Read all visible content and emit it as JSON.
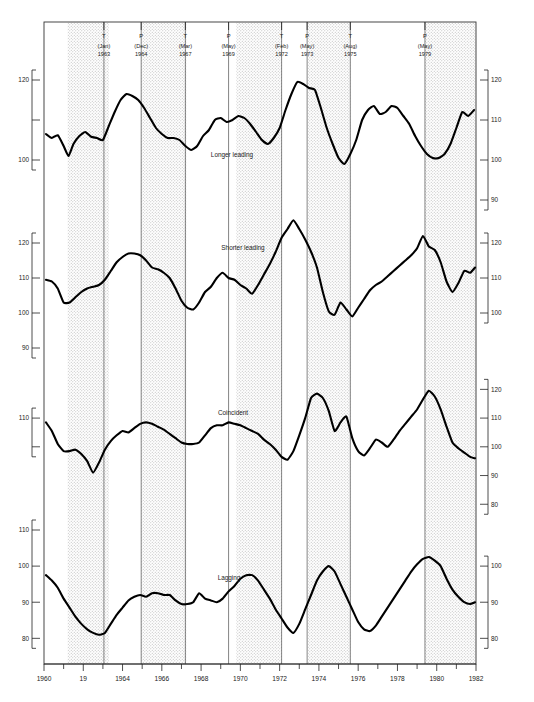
{
  "meta": {
    "kind": "composite-index-business-cycle-chart",
    "panel_count": 4
  },
  "chart_data": {
    "type": "line",
    "title": "",
    "xlabel": "",
    "ylabel": "",
    "grid": false,
    "legend_position": "inline-panel-label",
    "xlim": [
      1960,
      1982
    ],
    "x_ticks_labeled": [
      "1960",
      "19",
      "1964",
      "1966",
      "1968",
      "1970",
      "1972",
      "1974",
      "1976",
      "1978",
      "1980",
      "1982"
    ],
    "x_ticks_values": [
      1960,
      1962,
      1964,
      1966,
      1968,
      1970,
      1972,
      1974,
      1976,
      1978,
      1980,
      1982
    ],
    "x_minor_ticks": [
      1961,
      1963,
      1965,
      1967,
      1969,
      1971,
      1973,
      1975,
      1977,
      1979,
      1981
    ],
    "recession_bands": [
      {
        "start": 1961.2,
        "end": 1963.3
      },
      {
        "start": 1964.95,
        "end": 1967.25
      },
      {
        "start": 1969.8,
        "end": 1972.1
      },
      {
        "start": 1973.45,
        "end": 1975.6
      },
      {
        "start": 1979.4,
        "end": 1982.0
      }
    ],
    "turning_points": [
      {
        "type": "T",
        "month": "Jan",
        "year": "1963",
        "x": 1963.05
      },
      {
        "type": "P",
        "month": "Dec",
        "year": "1964",
        "x": 1964.95
      },
      {
        "type": "T",
        "month": "Mar",
        "year": "1967",
        "x": 1967.2
      },
      {
        "type": "P",
        "month": "May",
        "year": "1969",
        "x": 1969.4
      },
      {
        "type": "T",
        "month": "Feb",
        "year": "1972",
        "x": 1972.1
      },
      {
        "type": "P",
        "month": "May",
        "year": "1973",
        "x": 1973.4
      },
      {
        "type": "T",
        "month": "Aug",
        "year": "1975",
        "x": 1975.6
      },
      {
        "type": "P",
        "month": "May",
        "year": "1979",
        "x": 1979.4
      }
    ],
    "panels": [
      {
        "name": "Longer leading",
        "label": "Longer leading",
        "ylim": [
          90,
          125
        ],
        "left_ticks": [
          {
            "value": 120,
            "label": "120"
          },
          {
            "value": 110,
            "label": ""
          },
          {
            "value": 100,
            "label": "100"
          }
        ],
        "right_ticks": [
          {
            "value": 120,
            "label": "120"
          },
          {
            "value": 110,
            "label": "110"
          },
          {
            "value": 100,
            "label": "100"
          },
          {
            "value": 90,
            "label": "90"
          }
        ],
        "x": [
          1960.1,
          1960.4,
          1960.7,
          1961.0,
          1961.25,
          1961.5,
          1961.8,
          1962.1,
          1962.4,
          1962.7,
          1963.0,
          1963.3,
          1963.6,
          1963.9,
          1964.2,
          1964.5,
          1964.8,
          1965.1,
          1965.4,
          1965.7,
          1966.0,
          1966.3,
          1966.6,
          1966.9,
          1967.2,
          1967.5,
          1967.8,
          1968.1,
          1968.4,
          1968.7,
          1969.0,
          1969.3,
          1969.6,
          1969.9,
          1970.2,
          1970.5,
          1970.8,
          1971.1,
          1971.4,
          1971.7,
          1972.0,
          1972.3,
          1972.6,
          1972.9,
          1973.2,
          1973.5,
          1973.8,
          1974.1,
          1974.4,
          1974.7,
          1975.0,
          1975.3,
          1975.6,
          1975.9,
          1976.2,
          1976.5,
          1976.8,
          1977.1,
          1977.4,
          1977.7,
          1978.0,
          1978.3,
          1978.6,
          1978.9,
          1979.2,
          1979.5,
          1979.8,
          1980.1,
          1980.4,
          1980.7,
          1981.0,
          1981.3,
          1981.6,
          1981.9
        ],
        "y": [
          106.5,
          105.5,
          106.2,
          103.5,
          101.0,
          104.0,
          106.0,
          107.0,
          105.8,
          105.5,
          105.0,
          108.5,
          112.0,
          115.0,
          116.5,
          116.0,
          115.0,
          113.0,
          110.5,
          108.0,
          106.5,
          105.5,
          105.5,
          105.0,
          103.5,
          102.5,
          103.5,
          106.0,
          107.5,
          110.0,
          110.5,
          109.5,
          110.0,
          111.0,
          110.5,
          109.0,
          107.0,
          105.0,
          104.0,
          105.5,
          108.0,
          112.5,
          116.5,
          119.5,
          119.0,
          118.0,
          117.5,
          113.0,
          108.0,
          104.0,
          100.5,
          99.0,
          101.5,
          105.0,
          110.0,
          112.5,
          113.5,
          111.5,
          112.0,
          113.5,
          113.0,
          111.0,
          109.0,
          106.0,
          103.5,
          101.5,
          100.5,
          100.5,
          101.5,
          104.0,
          108.0,
          112.0,
          111.0,
          112.5
        ]
      },
      {
        "name": "Shorter leading",
        "label": "Shorter leading",
        "ylim": [
          88,
          128
        ],
        "left_ticks": [
          {
            "value": 120,
            "label": "120"
          },
          {
            "value": 110,
            "label": "110"
          },
          {
            "value": 100,
            "label": "100"
          },
          {
            "value": 90,
            "label": "90"
          }
        ],
        "right_ticks": [
          {
            "value": 120,
            "label": "120"
          },
          {
            "value": 110,
            "label": "110"
          },
          {
            "value": 100,
            "label": "100"
          }
        ],
        "x": [
          1960.1,
          1960.4,
          1960.7,
          1961.0,
          1961.3,
          1961.6,
          1961.9,
          1962.2,
          1962.5,
          1962.8,
          1963.1,
          1963.4,
          1963.7,
          1964.0,
          1964.3,
          1964.6,
          1964.9,
          1965.2,
          1965.5,
          1965.8,
          1966.1,
          1966.4,
          1966.7,
          1967.0,
          1967.3,
          1967.6,
          1967.9,
          1968.2,
          1968.5,
          1968.8,
          1969.1,
          1969.4,
          1969.7,
          1970.0,
          1970.3,
          1970.6,
          1970.9,
          1971.2,
          1971.5,
          1971.8,
          1972.1,
          1972.4,
          1972.7,
          1973.0,
          1973.3,
          1973.6,
          1973.9,
          1974.2,
          1974.5,
          1974.8,
          1975.1,
          1975.4,
          1975.7,
          1976.0,
          1976.3,
          1976.6,
          1976.9,
          1977.2,
          1977.5,
          1977.8,
          1978.1,
          1978.4,
          1978.7,
          1979.0,
          1979.3,
          1979.6,
          1979.9,
          1980.2,
          1980.5,
          1980.8,
          1981.1,
          1981.4,
          1981.7,
          1981.95
        ],
        "y": [
          109.5,
          109.0,
          107.0,
          103.0,
          103.0,
          104.5,
          106.0,
          107.0,
          107.5,
          108.0,
          109.5,
          112.0,
          114.5,
          116.0,
          117.0,
          117.0,
          116.5,
          115.0,
          113.0,
          112.5,
          111.5,
          110.0,
          107.0,
          103.5,
          101.5,
          101.0,
          103.0,
          106.0,
          107.5,
          110.0,
          111.5,
          110.0,
          109.5,
          108.0,
          107.0,
          105.5,
          108.0,
          111.0,
          114.0,
          117.5,
          121.5,
          124.0,
          126.5,
          124.0,
          121.0,
          117.5,
          113.0,
          106.0,
          100.5,
          99.5,
          103.0,
          101.0,
          99.0,
          101.5,
          104.0,
          106.5,
          108.0,
          109.0,
          110.5,
          112.0,
          113.5,
          115.0,
          116.5,
          118.5,
          122.0,
          119.0,
          118.0,
          114.5,
          109.0,
          106.0,
          108.5,
          112.0,
          111.5,
          113.0
        ]
      },
      {
        "name": "Coincident",
        "label": "Coincident",
        "ylim": [
          78,
          125
        ],
        "left_ticks": [
          {
            "value": 110,
            "label": "110"
          },
          {
            "value": 100,
            "label": ""
          }
        ],
        "right_ticks": [
          {
            "value": 120,
            "label": "120"
          },
          {
            "value": 110,
            "label": "110"
          },
          {
            "value": 100,
            "label": "100"
          },
          {
            "value": 90,
            "label": "90"
          },
          {
            "value": 80,
            "label": "80"
          }
        ],
        "x": [
          1960.1,
          1960.4,
          1960.7,
          1961.0,
          1961.3,
          1961.6,
          1961.9,
          1962.2,
          1962.5,
          1962.8,
          1963.1,
          1963.4,
          1963.7,
          1964.0,
          1964.3,
          1964.6,
          1964.9,
          1965.2,
          1965.5,
          1965.8,
          1966.1,
          1966.4,
          1966.7,
          1967.0,
          1967.3,
          1967.6,
          1967.9,
          1968.2,
          1968.5,
          1968.8,
          1969.1,
          1969.4,
          1969.7,
          1970.0,
          1970.3,
          1970.6,
          1970.9,
          1971.2,
          1971.5,
          1971.8,
          1972.1,
          1972.4,
          1972.7,
          1973.0,
          1973.3,
          1973.6,
          1973.9,
          1974.2,
          1974.5,
          1974.8,
          1975.1,
          1975.4,
          1975.7,
          1976.0,
          1976.3,
          1976.6,
          1976.9,
          1977.2,
          1977.5,
          1977.8,
          1978.1,
          1978.4,
          1978.7,
          1979.0,
          1979.3,
          1979.6,
          1979.9,
          1980.2,
          1980.5,
          1980.8,
          1981.1,
          1981.4,
          1981.7,
          1981.95
        ],
        "y": [
          108.5,
          105.5,
          101.0,
          98.5,
          98.5,
          99.0,
          97.5,
          95.0,
          91.0,
          94.5,
          99.0,
          102.0,
          104.0,
          105.5,
          105.0,
          106.5,
          108.0,
          108.5,
          108.0,
          107.0,
          106.0,
          104.5,
          103.0,
          101.5,
          101.0,
          101.0,
          101.5,
          104.0,
          106.5,
          107.5,
          107.5,
          108.5,
          108.0,
          107.5,
          106.5,
          105.5,
          104.5,
          102.5,
          101.0,
          99.0,
          96.5,
          95.5,
          98.5,
          104.0,
          110.0,
          117.0,
          118.5,
          117.0,
          112.5,
          105.5,
          108.5,
          110.5,
          103.0,
          98.5,
          97.0,
          99.5,
          102.5,
          101.5,
          100.0,
          102.5,
          105.5,
          108.0,
          110.5,
          113.0,
          116.5,
          119.5,
          117.5,
          113.0,
          107.0,
          101.5,
          99.5,
          98.0,
          96.5,
          96.0
        ]
      },
      {
        "name": "Lagging",
        "label": "Lagging",
        "ylim": [
          74,
          110
        ],
        "left_ticks": [
          {
            "value": 110,
            "label": "110"
          },
          {
            "value": 100,
            "label": "100"
          },
          {
            "value": 90,
            "label": "90"
          },
          {
            "value": 80,
            "label": "80"
          }
        ],
        "right_ticks": [
          {
            "value": 100,
            "label": "100"
          },
          {
            "value": 90,
            "label": "90"
          },
          {
            "value": 80,
            "label": "80"
          }
        ],
        "x": [
          1960.1,
          1960.4,
          1960.7,
          1961.0,
          1961.3,
          1961.6,
          1961.9,
          1962.2,
          1962.5,
          1962.8,
          1963.1,
          1963.4,
          1963.7,
          1964.0,
          1964.3,
          1964.6,
          1964.9,
          1965.2,
          1965.5,
          1965.8,
          1966.1,
          1966.4,
          1966.7,
          1967.0,
          1967.3,
          1967.6,
          1967.9,
          1968.2,
          1968.5,
          1968.8,
          1969.1,
          1969.4,
          1969.7,
          1970.0,
          1970.3,
          1970.6,
          1970.9,
          1971.2,
          1971.5,
          1971.8,
          1972.1,
          1972.4,
          1972.7,
          1973.0,
          1973.3,
          1973.6,
          1973.9,
          1974.2,
          1974.5,
          1974.8,
          1975.1,
          1975.4,
          1975.7,
          1976.0,
          1976.3,
          1976.6,
          1976.9,
          1977.2,
          1977.5,
          1977.8,
          1978.1,
          1978.4,
          1978.7,
          1979.0,
          1979.3,
          1979.6,
          1979.9,
          1980.2,
          1980.5,
          1980.8,
          1981.1,
          1981.4,
          1981.7,
          1981.95
        ],
        "y": [
          97.5,
          96.0,
          94.0,
          91.0,
          88.5,
          86.0,
          84.0,
          82.5,
          81.5,
          81.0,
          81.5,
          84.0,
          86.5,
          88.5,
          90.5,
          91.5,
          92.0,
          91.5,
          92.5,
          92.5,
          92.0,
          92.0,
          90.5,
          89.5,
          89.5,
          90.0,
          92.5,
          91.0,
          90.5,
          90.0,
          91.0,
          93.0,
          94.5,
          96.5,
          97.5,
          97.5,
          96.0,
          93.5,
          91.0,
          88.0,
          85.5,
          83.0,
          81.5,
          84.0,
          88.0,
          92.0,
          96.0,
          98.5,
          100.0,
          98.5,
          95.0,
          91.5,
          88.0,
          84.5,
          82.5,
          82.0,
          83.5,
          86.0,
          88.5,
          91.0,
          93.5,
          96.0,
          98.5,
          100.5,
          102.0,
          102.5,
          101.5,
          100.0,
          96.5,
          93.5,
          91.5,
          90.0,
          89.5,
          90.0
        ]
      }
    ]
  }
}
